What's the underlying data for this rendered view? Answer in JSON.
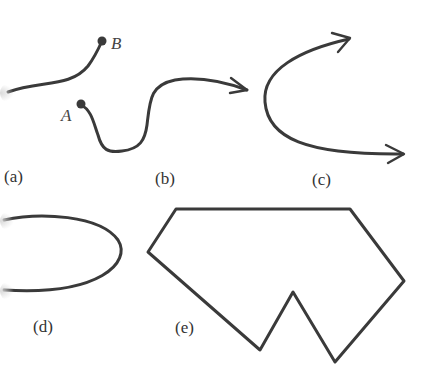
{
  "figure": {
    "panels": [
      {
        "id": "a",
        "label": "(a)",
        "description": "open curve with endpoints",
        "points": [
          {
            "name": "B",
            "label": "B"
          }
        ]
      },
      {
        "id": "b",
        "label": "(b)",
        "description": "curve from point A ending in arrow",
        "points": [
          {
            "name": "A",
            "label": "A"
          }
        ]
      },
      {
        "id": "c",
        "label": "(c)",
        "description": "curve with arrows at both ends"
      },
      {
        "id": "d",
        "label": "(d)",
        "description": "closed oval curve"
      },
      {
        "id": "e",
        "label": "(e)",
        "description": "closed polygon with notch"
      }
    ]
  },
  "colors": {
    "stroke": "#3a3a3a",
    "background": "#ffffff"
  }
}
